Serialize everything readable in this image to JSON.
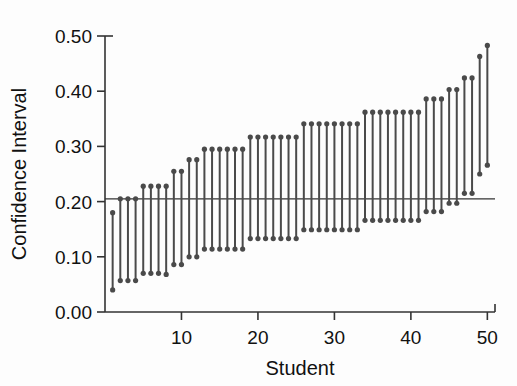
{
  "chart_data": {
    "type": "line",
    "title": "",
    "subtitle": "",
    "xlabel": "Student",
    "ylabel": "Confidence Interval",
    "xlim": [
      0,
      51
    ],
    "ylim": [
      0.0,
      0.5
    ],
    "xticks": [
      10,
      20,
      30,
      40,
      50
    ],
    "xticklabels": [
      "10",
      "20",
      "30",
      "40",
      "50"
    ],
    "yticks": [
      0.0,
      0.1,
      0.2,
      0.3,
      0.4,
      0.5
    ],
    "yticklabels": [
      "0.00",
      "0.10",
      "0.20",
      "0.30",
      "0.40",
      "0.50"
    ],
    "grid": false,
    "legend": null,
    "reference_line": {
      "orientation": "horizontal",
      "value": 0.205,
      "label": ""
    },
    "series": [
      {
        "name": "Confidence Interval",
        "marker": "circle",
        "color": "#4a4a4a",
        "x": [
          1,
          2,
          3,
          4,
          5,
          6,
          7,
          8,
          9,
          10,
          11,
          12,
          13,
          14,
          15,
          16,
          17,
          18,
          19,
          20,
          21,
          22,
          23,
          24,
          25,
          26,
          27,
          28,
          29,
          30,
          31,
          32,
          33,
          34,
          35,
          36,
          37,
          38,
          39,
          40,
          41,
          42,
          43,
          44,
          45,
          46,
          47,
          48,
          49,
          50
        ],
        "lower": [
          0.04,
          0.057,
          0.057,
          0.057,
          0.07,
          0.07,
          0.07,
          0.068,
          0.086,
          0.086,
          0.1,
          0.1,
          0.114,
          0.114,
          0.114,
          0.114,
          0.114,
          0.114,
          0.133,
          0.133,
          0.133,
          0.133,
          0.133,
          0.133,
          0.133,
          0.149,
          0.149,
          0.149,
          0.149,
          0.149,
          0.149,
          0.149,
          0.149,
          0.166,
          0.166,
          0.166,
          0.166,
          0.166,
          0.166,
          0.166,
          0.166,
          0.182,
          0.182,
          0.182,
          0.197,
          0.197,
          0.215,
          0.215,
          0.25,
          0.266
        ],
        "upper": [
          0.18,
          0.205,
          0.205,
          0.205,
          0.228,
          0.228,
          0.228,
          0.228,
          0.255,
          0.255,
          0.276,
          0.276,
          0.295,
          0.295,
          0.295,
          0.295,
          0.295,
          0.295,
          0.317,
          0.317,
          0.317,
          0.317,
          0.317,
          0.317,
          0.317,
          0.341,
          0.341,
          0.341,
          0.341,
          0.341,
          0.341,
          0.341,
          0.341,
          0.362,
          0.362,
          0.362,
          0.362,
          0.362,
          0.362,
          0.362,
          0.362,
          0.386,
          0.386,
          0.386,
          0.403,
          0.403,
          0.424,
          0.424,
          0.463,
          0.483
        ]
      }
    ]
  },
  "labels": {
    "xlabel": "Student",
    "ylabel": "Confidence Interval"
  }
}
